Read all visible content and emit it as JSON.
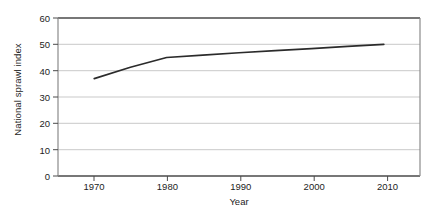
{
  "chart_data": {
    "type": "line",
    "title": "",
    "xlabel": "Year",
    "ylabel": "National sprawl index",
    "xlim": [
      1965,
      2015
    ],
    "ylim": [
      0,
      60
    ],
    "xticks": [
      1970,
      1980,
      1990,
      2000,
      2010
    ],
    "xtick_labels": [
      "1970",
      "1980",
      "1990",
      "2000",
      "2010"
    ],
    "yticks": [
      0,
      10,
      20,
      30,
      40,
      50,
      60
    ],
    "ytick_labels": [
      "0",
      "10",
      "20",
      "30",
      "40",
      "50",
      "60"
    ],
    "grid": "horizontal",
    "legend": "none",
    "series": [
      {
        "name": "National sprawl index",
        "x": [
          1970,
          1975,
          1980,
          1985,
          1990,
          1995,
          2000,
          2005,
          2010
        ],
        "values": [
          37.0,
          41.3,
          45.0,
          45.9,
          46.8,
          47.6,
          48.4,
          49.2,
          50.0
        ]
      }
    ],
    "colors": {
      "line": "#2b2b2b",
      "grid": "#c9c9c9",
      "frame": "#4a4a4a",
      "text": "#1d1d1d",
      "background": "#ffffff"
    }
  },
  "axes": {
    "y_title": "National sprawl index",
    "x_title": "Year"
  }
}
